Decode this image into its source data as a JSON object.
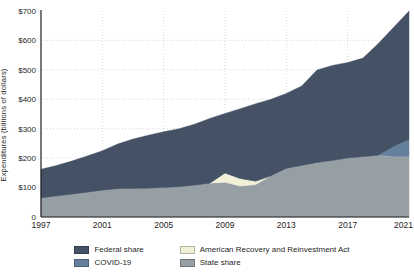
{
  "chart_data": {
    "type": "area",
    "stacked": true,
    "title": "",
    "xlabel": "",
    "ylabel": "Expenditures (billions of dollars)",
    "grid": "dotted",
    "legend_position": "bottom",
    "ylim": [
      0,
      700
    ],
    "x": [
      1997,
      1998,
      1999,
      2000,
      2001,
      2002,
      2003,
      2004,
      2005,
      2006,
      2007,
      2008,
      2009,
      2010,
      2011,
      2012,
      2013,
      2014,
      2015,
      2016,
      2017,
      2018,
      2019,
      2020,
      2021
    ],
    "x_ticks": [
      1997,
      2001,
      2005,
      2009,
      2013,
      2017,
      2021
    ],
    "y_ticks": [
      {
        "value": 0,
        "label": "0"
      },
      {
        "value": 100,
        "label": "$100"
      },
      {
        "value": 200,
        "label": "$200"
      },
      {
        "value": 300,
        "label": "$300"
      },
      {
        "value": 400,
        "label": "$400"
      },
      {
        "value": 500,
        "label": "$500"
      },
      {
        "value": 600,
        "label": "$600"
      },
      {
        "value": 700,
        "label": "$700"
      }
    ],
    "series": [
      {
        "name": "State share",
        "color": "#96a0a4",
        "values": [
          65,
          71,
          77,
          84,
          91,
          96,
          97,
          98,
          100,
          103,
          108,
          115,
          118,
          105,
          110,
          140,
          165,
          175,
          185,
          192,
          200,
          205,
          210,
          205,
          205
        ]
      },
      {
        "name": "American Recovery and Reinvestment Act",
        "color": "#f3f0d8",
        "values": [
          0,
          0,
          0,
          0,
          0,
          0,
          0,
          0,
          0,
          0,
          0,
          0,
          32,
          26,
          12,
          0,
          0,
          0,
          0,
          0,
          0,
          0,
          0,
          0,
          0
        ]
      },
      {
        "name": "COVID-19",
        "color": "#65809d",
        "values": [
          0,
          0,
          0,
          0,
          0,
          0,
          0,
          0,
          0,
          0,
          0,
          0,
          0,
          0,
          0,
          0,
          0,
          0,
          0,
          0,
          0,
          0,
          0,
          35,
          58
        ]
      },
      {
        "name": "Federal share",
        "color": "#455266",
        "values": [
          97,
          104,
          113,
          123,
          134,
          152,
          168,
          180,
          190,
          197,
          207,
          220,
          202,
          237,
          263,
          260,
          255,
          270,
          315,
          323,
          325,
          335,
          380,
          405,
          437
        ]
      }
    ],
    "legend_display_order": [
      "Federal share",
      "COVID-19",
      "American Recovery and Reinvestment Act",
      "State share"
    ],
    "axis_color": "#1f1f1f",
    "gridline_color": "#c9cdd1"
  }
}
